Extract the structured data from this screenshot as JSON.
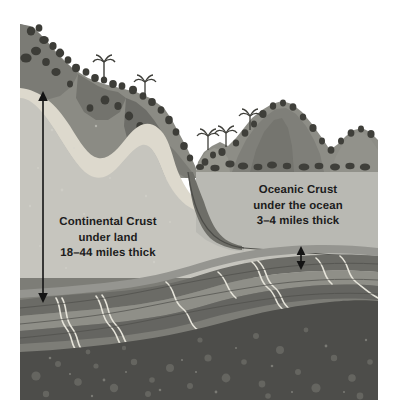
{
  "illustration": {
    "title": "Earth crust cross-section",
    "bounds": {
      "left": 20,
      "top": 22,
      "right": 378,
      "bottom": 400
    }
  },
  "labels": {
    "continental": {
      "name": "Continental Crust",
      "line1": "Continental Crust",
      "line2": "under land",
      "line3": "18–44 miles thick",
      "thickness_min_miles": 18,
      "thickness_max_miles": 44
    },
    "oceanic": {
      "name": "Oceanic Crust",
      "line1": "Oceanic Crust",
      "line2": "under the ocean",
      "line3": "3–4 miles thick",
      "thickness_min_miles": 3,
      "thickness_max_miles": 4
    }
  },
  "measurements": [
    {
      "id": "continental-thickness-arrow",
      "label": "continental crust thickness",
      "x": 43,
      "y_top": 92,
      "y_bottom": 302
    },
    {
      "id": "oceanic-thickness-arrow",
      "label": "oceanic crust thickness",
      "x": 301,
      "y_top": 247,
      "y_bottom": 269
    }
  ],
  "colors": {
    "background": "#ffffff",
    "text": "#1c1c1c",
    "arrow": "#141414",
    "mountain_far": "#9a9a93",
    "mountain_mid": "#8b8b84",
    "mountain_near": "#7c7c76",
    "mountain_shadow": "#6b6b66",
    "tree_dark": "#44443f",
    "tree_mid": "#55554f",
    "soil_highlight": "#d8d6cd",
    "continental_crust": "#c3c2bb",
    "continental_crust_light": "#cfcec6",
    "ocean_water": "#b9b9b3",
    "ocean_floor_crust": "#b4b3ad",
    "shelf_slope": "#7e7e78",
    "mantle_band_1": "#8e8e88",
    "mantle_band_2": "#6f6f6a",
    "mantle_band_3": "#7d7d77",
    "mantle_band_4": "#5f5f5b",
    "mantle_streak": "#e4e3da",
    "core_layer": "#4b4b48",
    "core_spot": "#63635e"
  },
  "layers": [
    {
      "id": "sky",
      "label": "sky / background"
    },
    {
      "id": "mountains",
      "label": "mountain range with trees"
    },
    {
      "id": "soil",
      "label": "light soil surface layer"
    },
    {
      "id": "continental-crust",
      "label": "continental crust body"
    },
    {
      "id": "ocean",
      "label": "ocean water"
    },
    {
      "id": "oceanic-crust",
      "label": "oceanic crust slab"
    },
    {
      "id": "mantle",
      "label": "banded mantle rock layers"
    },
    {
      "id": "deep-mantle",
      "label": "deep speckled mantle"
    }
  ]
}
